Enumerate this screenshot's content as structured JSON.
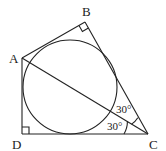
{
  "diagram": {
    "type": "geometry",
    "vertices": {
      "A": {
        "label": "A",
        "x": 22,
        "y": 58
      },
      "B": {
        "label": "B",
        "x": 85,
        "y": 22
      },
      "C": {
        "label": "C",
        "x": 148,
        "y": 134
      },
      "D": {
        "label": "D",
        "x": 22,
        "y": 134
      }
    },
    "angles": [
      {
        "label": "30°",
        "at": "C",
        "between": [
          "CB",
          "CA"
        ]
      },
      {
        "label": "30°",
        "at": "C",
        "between": [
          "CA",
          "CD"
        ]
      }
    ],
    "right_angles": [
      "B",
      "D"
    ],
    "inscribed_circle": {
      "cx": 70,
      "cy": 87,
      "r": 47
    },
    "segments": [
      "AB",
      "BC",
      "CD",
      "DA",
      "AC"
    ]
  }
}
